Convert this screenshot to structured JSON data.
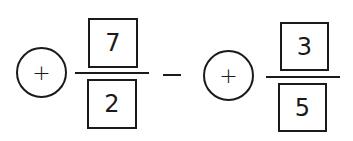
{
  "expression": {
    "left_term": {
      "sign": "+",
      "numerator": "7",
      "denominator": "2"
    },
    "operator": "−",
    "right_term": {
      "sign": "+",
      "numerator": "3",
      "denominator": "5"
    }
  }
}
